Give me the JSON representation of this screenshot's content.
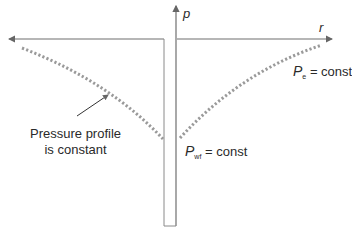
{
  "diagram": {
    "axes": {
      "horizontal_label": "r",
      "vertical_label": "p"
    },
    "annotations": {
      "profile_note_line1": "Pressure profile",
      "profile_note_line2": "is constant",
      "outer_boundary": {
        "symbol": "P",
        "subscript": "e",
        "text": "= const"
      },
      "wellbore": {
        "symbol": "P",
        "subscript": "wf",
        "text": "= const"
      }
    },
    "colors": {
      "axis": "#6f6f6f",
      "profile_dots": "#9a9a9a",
      "text": "#2a2a2a"
    }
  }
}
